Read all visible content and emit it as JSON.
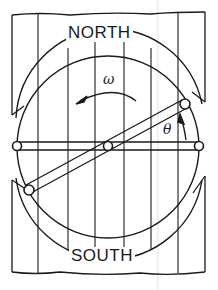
{
  "figure": {
    "labels": {
      "north": "NORTH",
      "south": "SOUTH",
      "omega": "ω",
      "theta": "θ"
    },
    "colors": {
      "ink": "#1a1a1a",
      "background": "#ffffff"
    },
    "elements": [
      "north pole piece with vertical field lines",
      "south pole piece with vertical field lines",
      "circular rotor (double ring)",
      "horizontal fixed bar with end pivots",
      "rotating rod at angle theta with end pivots",
      "central pivot",
      "curved arrow indicating angular velocity omega (counterclockwise)",
      "small arrow indicating angle theta"
    ]
  }
}
